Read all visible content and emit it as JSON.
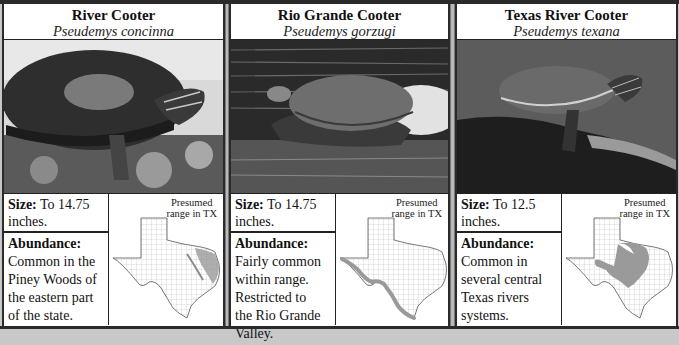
{
  "map_caption_line1": "Presumed",
  "map_caption_line2": "range in TX",
  "size_label": "Size:",
  "abundance_label": "Abundance:",
  "colors": {
    "border": "#2a2a2a",
    "divider": "#b9b9b9",
    "range_fill": "#9a9a9a",
    "county_lines": "#b0b0b0"
  },
  "species": [
    {
      "common_name": "River Cooter",
      "scientific_name": "Pseudemys concinna",
      "photo_icon": "river-cooter-photo",
      "size_value": "To 14.75 inches.",
      "abundance_lines": [
        "Common in the",
        "Piney Woods of",
        "the eastern part",
        "of the state."
      ],
      "range_region": "eastern Texas (Piney Woods, east river corridors)"
    },
    {
      "common_name": "Rio Grande Cooter",
      "scientific_name": "Pseudemys gorzugi",
      "photo_icon": "rio-grande-cooter-photo",
      "size_value": "To 14.75 inches.",
      "abundance_lines": [
        "Fairly common",
        "within range.",
        "Restricted to",
        "the Rio Grande",
        "Valley."
      ],
      "range_region": "Rio Grande corridor along southwestern border"
    },
    {
      "common_name": "Texas River Cooter",
      "scientific_name": "Pseudemys texana",
      "photo_icon": "texas-river-cooter-photo",
      "size_value": "To 12.5 inches.",
      "abundance_lines": [
        "Common in",
        "several central",
        "Texas rivers",
        "systems."
      ],
      "range_region": "central Texas river systems"
    }
  ]
}
